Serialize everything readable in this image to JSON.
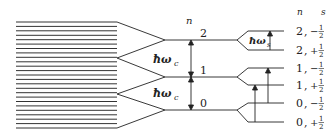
{
  "diagram": {
    "continuum_lines": 25,
    "colors": {
      "line": "#222222",
      "background": "#ffffff"
    },
    "header": {
      "n": "n",
      "s": "s"
    },
    "levels": [
      {
        "n": "2",
        "y": 40
      },
      {
        "n": "1",
        "y": 77
      },
      {
        "n": "0",
        "y": 110
      }
    ],
    "gap_labels": [
      {
        "text": "ħω",
        "sub": "c",
        "y": 62
      },
      {
        "text": "ħω",
        "sub": "c",
        "y": 96
      }
    ],
    "spin_gap_label": {
      "text": "ħω",
      "sub": "s"
    },
    "spin_levels": [
      {
        "n": "2",
        "sep": ",",
        "sign": "−",
        "num": "1",
        "den": "2",
        "y": 31
      },
      {
        "n": "2",
        "sep": ",",
        "sign": "+",
        "num": "1",
        "den": "2",
        "y": 50
      },
      {
        "n": "1",
        "sep": ",",
        "sign": "−",
        "num": "1",
        "den": "2",
        "y": 68
      },
      {
        "n": "1",
        "sep": ",",
        "sign": "+",
        "num": "1",
        "den": "2",
        "y": 85
      },
      {
        "n": "0",
        "sep": ",",
        "sign": "−",
        "num": "1",
        "den": "2",
        "y": 103
      },
      {
        "n": "0",
        "sep": ",",
        "sign": "+",
        "num": "1",
        "den": "2",
        "y": 122
      }
    ]
  }
}
